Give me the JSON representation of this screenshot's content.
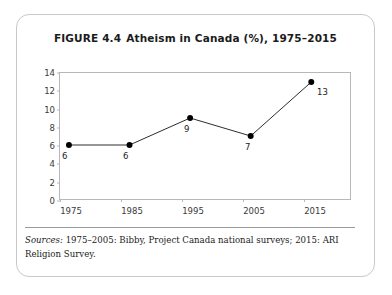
{
  "figure": {
    "label": "FIGURE 4.4",
    "title": "Atheism in Canada (%), 1975–2015",
    "full_title": "FIGURE 4.4  Atheism in Canada (%), 1975–2015"
  },
  "source": {
    "label": "Sources:",
    "text": " 1975–2005: Bibby, Project Canada national surveys; 2015: ARI Religion Survey."
  },
  "colors": {
    "line": "#2b2b2b",
    "marker": "#000000",
    "frame": "#b8b8bc",
    "card_border": "#c9c9c9",
    "text": "#1b1b1b",
    "tick_text": "#3a3a3a",
    "background": "#ffffff"
  },
  "chart_data": {
    "type": "line",
    "xlabel": "",
    "ylabel": "",
    "x": [
      1975,
      1985,
      1995,
      2005,
      2015
    ],
    "categories": [
      "1975",
      "1985",
      "1995",
      "2005",
      "2015"
    ],
    "values": [
      6,
      6,
      9,
      7,
      13
    ],
    "point_labels": [
      "6",
      "6",
      "9",
      "7",
      "13"
    ],
    "ylim": [
      0,
      14
    ],
    "yticks": [
      0,
      2,
      4,
      6,
      8,
      10,
      12,
      14
    ],
    "ytick_labels": [
      "0",
      "2",
      "4",
      "6",
      "8",
      "10",
      "12",
      "14"
    ],
    "xtick_labels": [
      "1975",
      "1985",
      "1995",
      "2005",
      "2015"
    ],
    "grid": false,
    "legend": false,
    "markers": true,
    "marker_style": "filled-circle",
    "units": "percent"
  }
}
